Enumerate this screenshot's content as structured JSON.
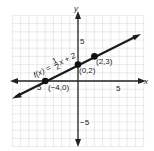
{
  "chart_data": {
    "type": "line",
    "title": "",
    "xlabel": "x",
    "ylabel": "y",
    "xlim": [
      -8,
      8
    ],
    "ylim": [
      -8,
      8
    ],
    "grid": true,
    "x_ticks_labeled": [
      {
        "value": -5,
        "label": "-5"
      },
      {
        "value": 5,
        "label": "5"
      }
    ],
    "y_ticks_labeled": [
      {
        "value": 5,
        "label": "5"
      },
      {
        "value": -5,
        "label": "-5"
      }
    ],
    "series": [
      {
        "name": "f(x) = 1/2 x + 2",
        "equation": "f(x) = (1/2)x + 2",
        "slope": 0.5,
        "intercept": 2,
        "points": [
          {
            "x": -4,
            "y": 0,
            "label": "(−4,0)"
          },
          {
            "x": 0,
            "y": 2,
            "label": "(0,2)"
          },
          {
            "x": 2,
            "y": 3,
            "label": "(2,3)"
          }
        ]
      }
    ]
  },
  "labels": {
    "x_axis": "x",
    "y_axis": "y",
    "x_tick_neg": "5",
    "x_tick_pos": "5",
    "y_tick_pos": "5",
    "y_tick_neg": "−5",
    "equation_prefix": "f(x) = ",
    "equation_num": "1",
    "equation_den": "2",
    "equation_suffix": "x + 2",
    "point_a": "(−4,0)",
    "point_b": "(0,2)",
    "point_c": "(2,3)"
  },
  "colors": {
    "grid": "#e4e4e4",
    "axis": "#222222",
    "line": "#1a1a1a"
  }
}
